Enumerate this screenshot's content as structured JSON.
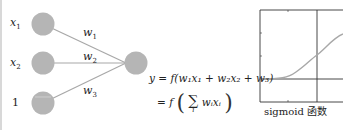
{
  "diagram": {
    "inputs": [
      {
        "label": "x",
        "sub": "1"
      },
      {
        "label": "x",
        "sub": "2"
      },
      {
        "label": "1",
        "sub": ""
      }
    ],
    "weights": [
      {
        "label": "w",
        "sub": "1"
      },
      {
        "label": "w",
        "sub": "2"
      },
      {
        "label": "w",
        "sub": "3"
      }
    ],
    "equation_line1": "y = f(w₁x₁ + w₂x₂ + w₃)",
    "equation_line2_prefix": "= f",
    "equation_sum_term": "wᵢxᵢ",
    "equation_sum_index": "i",
    "node_color": "#b5b5b5",
    "edge_color": "#a8a8a8",
    "plot": {
      "caption": "sigmoid 函数",
      "curve": "sigmoid",
      "curve_color": "#a8a8a8",
      "axis_color": "#333333"
    }
  }
}
